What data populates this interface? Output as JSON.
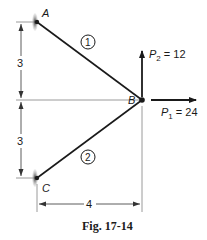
{
  "figure": {
    "caption": "Fig. 17-14",
    "nodes": [
      {
        "id": "A",
        "label": "A",
        "type": "support"
      },
      {
        "id": "B",
        "label": "B",
        "type": "joint"
      },
      {
        "id": "C",
        "label": "C",
        "type": "support"
      }
    ],
    "members": [
      {
        "id": "1",
        "label": "1",
        "from": "A",
        "to": "B"
      },
      {
        "id": "2",
        "label": "2",
        "from": "C",
        "to": "B"
      }
    ],
    "loads": {
      "p1": {
        "symbol": "P",
        "subscript": "1",
        "value": "24",
        "direction": "right"
      },
      "p2": {
        "symbol": "P",
        "subscript": "2",
        "value": "12",
        "direction": "up"
      }
    },
    "dimensions": {
      "upper_vertical": "3",
      "lower_vertical": "3",
      "horizontal": "4"
    },
    "colors": {
      "ink": "#1a1a1a",
      "guide": "#9a9a9a"
    }
  }
}
